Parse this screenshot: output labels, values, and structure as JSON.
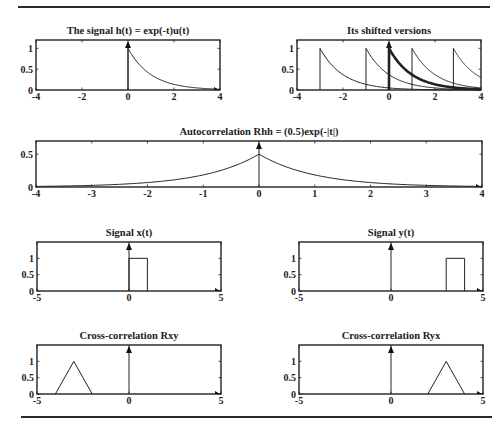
{
  "figure": {
    "caption_fragment": "Figure 1.5  Autocorrelation and cross-correlation examples"
  },
  "chart_data": [
    {
      "id": "h",
      "type": "line",
      "title": "The signal h(t) = exp(-t)u(t)",
      "xlim": [
        -4,
        4
      ],
      "ylim": [
        0,
        1.2
      ],
      "xticks": [
        "-4",
        "-2",
        "0",
        "2",
        "4"
      ],
      "xtick_values": [
        -4,
        -2,
        0,
        2,
        4
      ],
      "yticks": [
        "0",
        "0.5",
        "1"
      ],
      "ytick_values": [
        0,
        0.5,
        1
      ],
      "box": [
        36,
        40,
        220,
        90
      ],
      "series": [
        {
          "name": "h(t)",
          "kind": "exp_decay",
          "shift": 0,
          "amp": 1,
          "width": 1
        }
      ],
      "arrow_y": true,
      "arrow_x": true
    },
    {
      "id": "shifted",
      "type": "line",
      "title": "Its shifted versions",
      "xlim": [
        -4,
        4
      ],
      "ylim": [
        0,
        1.2
      ],
      "xticks": [
        "-4",
        "-2",
        "0",
        "2",
        "4"
      ],
      "xtick_values": [
        -4,
        -2,
        0,
        2,
        4
      ],
      "yticks": [
        "0",
        "0.5",
        "1"
      ],
      "ytick_values": [
        0,
        0.5,
        1
      ],
      "box": [
        297,
        40,
        481,
        90
      ],
      "series": [
        {
          "name": "h(t+3)",
          "kind": "exp_decay",
          "shift": -3,
          "amp": 1,
          "width": 1
        },
        {
          "name": "h(t+1)",
          "kind": "exp_decay",
          "shift": -1,
          "amp": 1,
          "width": 1
        },
        {
          "name": "h(t)",
          "kind": "exp_decay",
          "shift": 0,
          "amp": 1,
          "width": 2.6
        },
        {
          "name": "h(t-1)",
          "kind": "exp_decay",
          "shift": 1,
          "amp": 1,
          "width": 1
        },
        {
          "name": "h(t-2.8)",
          "kind": "exp_decay",
          "shift": 2.8,
          "amp": 1,
          "width": 1
        }
      ],
      "arrow_y": true,
      "arrow_x": true
    },
    {
      "id": "rhh",
      "type": "line",
      "title": "Autocorrelation  Rhh = (0.5)exp(-|t|)",
      "xlim": [
        -4,
        4
      ],
      "ylim": [
        0,
        0.7
      ],
      "xticks": [
        "-4",
        "-3",
        "-2",
        "-1",
        "0",
        "1",
        "2",
        "3",
        "4"
      ],
      "xtick_values": [
        -4,
        -3,
        -2,
        -1,
        0,
        1,
        2,
        3,
        4
      ],
      "yticks": [
        "0",
        "0.5"
      ],
      "ytick_values": [
        0,
        0.5
      ],
      "box": [
        36,
        141,
        482,
        187
      ],
      "series": [
        {
          "name": "Rhh(t)",
          "kind": "two_sided_exp",
          "shift": 0,
          "amp": 0.5,
          "width": 1
        }
      ],
      "arrow_y": true,
      "arrow_x": true
    },
    {
      "id": "x",
      "type": "line",
      "title": "Signal x(t)",
      "xlim": [
        -5,
        5
      ],
      "ylim": [
        0,
        1.5
      ],
      "xticks": [
        "-5",
        "0",
        "5"
      ],
      "xtick_values": [
        -5,
        0,
        5
      ],
      "yticks": [
        "0",
        "0.5",
        "1"
      ],
      "ytick_values": [
        0,
        0.5,
        1
      ],
      "box": [
        37,
        242,
        221,
        291
      ],
      "series": [
        {
          "name": "x(t)",
          "kind": "rect",
          "start": 0,
          "end": 1,
          "amp": 1,
          "width": 1
        }
      ],
      "arrow_y": true,
      "arrow_x": true
    },
    {
      "id": "y",
      "type": "line",
      "title": "Signal y(t)",
      "xlim": [
        -5,
        5
      ],
      "ylim": [
        0,
        1.5
      ],
      "xticks": [
        "-5",
        "0",
        "5"
      ],
      "xtick_values": [
        -5,
        0,
        5
      ],
      "yticks": [
        "0",
        "0.5",
        "1"
      ],
      "ytick_values": [
        0,
        0.5,
        1
      ],
      "box": [
        299,
        242,
        483,
        291
      ],
      "series": [
        {
          "name": "y(t)",
          "kind": "rect",
          "start": 3,
          "end": 4,
          "amp": 1,
          "width": 1
        }
      ],
      "arrow_y": true,
      "arrow_x": true
    },
    {
      "id": "rxy",
      "type": "line",
      "title": "Cross-correlation Rxy",
      "xlim": [
        -5,
        5
      ],
      "ylim": [
        0,
        1.5
      ],
      "xticks": [
        "-5",
        "0",
        "5"
      ],
      "xtick_values": [
        -5,
        0,
        5
      ],
      "yticks": [
        "0",
        "0.5",
        "1"
      ],
      "ytick_values": [
        0,
        0.5,
        1
      ],
      "box": [
        37,
        345,
        221,
        394
      ],
      "series": [
        {
          "name": "Rxy(t)",
          "kind": "triangle",
          "center": -3,
          "halfwidth": 1,
          "amp": 1,
          "width": 1
        }
      ],
      "arrow_y": true,
      "arrow_x": true
    },
    {
      "id": "ryx",
      "type": "line",
      "title": "Cross-correlation Ryx",
      "xlim": [
        -5,
        5
      ],
      "ylim": [
        0,
        1.5
      ],
      "xticks": [
        "-5",
        "0",
        "5"
      ],
      "xtick_values": [
        -5,
        0,
        5
      ],
      "yticks": [
        "0",
        "0.5",
        "1"
      ],
      "ytick_values": [
        0,
        0.5,
        1
      ],
      "box": [
        299,
        345,
        483,
        394
      ],
      "series": [
        {
          "name": "Ryx(t)",
          "kind": "triangle",
          "center": 3,
          "halfwidth": 1,
          "amp": 1,
          "width": 1
        }
      ],
      "arrow_y": true,
      "arrow_x": true
    }
  ]
}
